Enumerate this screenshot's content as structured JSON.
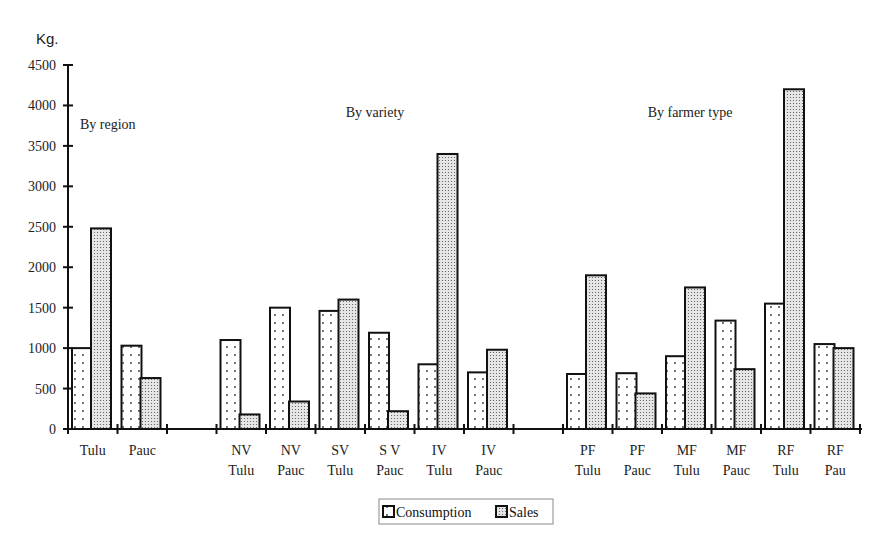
{
  "chart_data": {
    "type": "bar",
    "title": "",
    "ylabel": "Kg.",
    "xlabel": "",
    "ylim": [
      0,
      4500
    ],
    "yticks": [
      0,
      500,
      1000,
      1500,
      2000,
      2500,
      3000,
      3500,
      4000,
      4500
    ],
    "grid": false,
    "legend_position": "bottom-center",
    "groups": [
      {
        "title": "By region",
        "categories": [
          0,
          1
        ]
      },
      {
        "title": "By variety",
        "categories": [
          3,
          4,
          5,
          6,
          7,
          8
        ]
      },
      {
        "title": "By farmer type",
        "categories": [
          10,
          11,
          12,
          13,
          14,
          15
        ]
      }
    ],
    "categories": [
      [
        "Tulu"
      ],
      [
        "Pauc"
      ],
      [
        ""
      ],
      [
        "NV",
        "Tulu"
      ],
      [
        "NV",
        "Pauc"
      ],
      [
        "SV",
        "Tulu"
      ],
      [
        "S V",
        "Pauc"
      ],
      [
        "IV",
        "Tulu"
      ],
      [
        "IV",
        "Pauc"
      ],
      [
        ""
      ],
      [
        "PF",
        "Tulu"
      ],
      [
        "PF",
        "Pauc"
      ],
      [
        "MF",
        "Tulu"
      ],
      [
        "MF",
        "Pauc"
      ],
      [
        "RF",
        "Tulu"
      ],
      [
        "RF",
        "Pau"
      ]
    ],
    "series": [
      {
        "name": "Consumption",
        "pattern": "sparse-dots",
        "values": [
          1000,
          1030,
          null,
          1100,
          1500,
          1460,
          1190,
          800,
          700,
          null,
          680,
          690,
          900,
          1340,
          1550,
          1050
        ]
      },
      {
        "name": "Sales",
        "pattern": "dense-dots",
        "values": [
          2480,
          630,
          null,
          180,
          340,
          1600,
          220,
          3400,
          980,
          null,
          1900,
          440,
          1750,
          740,
          4200,
          1000
        ]
      }
    ]
  }
}
